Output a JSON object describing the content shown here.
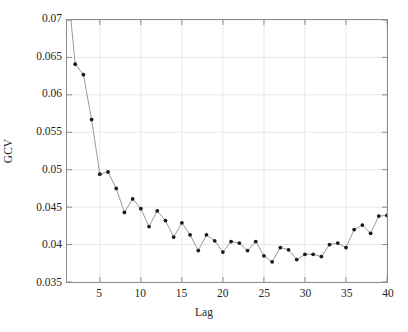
{
  "chart_data": {
    "type": "line",
    "title": "",
    "subtitle": "",
    "xlabel": "Lag",
    "ylabel": "GCV",
    "xlim": [
      1,
      40
    ],
    "ylim": [
      0.035,
      0.07
    ],
    "xticks": [
      5,
      10,
      15,
      20,
      25,
      30,
      35,
      40
    ],
    "xtick_labels": [
      "5",
      "10",
      "15",
      "20",
      "25",
      "30",
      "35",
      "40"
    ],
    "yticks": [
      0.035,
      0.04,
      0.045,
      0.05,
      0.055,
      0.06,
      0.065,
      0.07
    ],
    "ytick_labels": [
      "0.035",
      "0.04",
      "0.045",
      "0.05",
      "0.055",
      "0.06",
      "0.065",
      "0.07"
    ],
    "grid": true,
    "legend": null,
    "legend_position": "none",
    "annotations": [],
    "marker": "dot",
    "line_color": "#8c8c8c",
    "marker_color": "#1a1a1a",
    "grid_color": "#e8e8ec",
    "axis_color": "#8c8c8c",
    "note": "First data point at Lag 1 lies above the visible y-axis maximum and is clipped at the top of the axes.",
    "series": [
      {
        "name": "GCV",
        "x": [
          1,
          2,
          3,
          4,
          5,
          6,
          7,
          8,
          9,
          10,
          11,
          12,
          13,
          14,
          15,
          16,
          17,
          18,
          19,
          20,
          21,
          22,
          23,
          24,
          25,
          26,
          27,
          28,
          29,
          30,
          31,
          32,
          33,
          34,
          35,
          36,
          37,
          38,
          39,
          40
        ],
        "values": [
          0.0755,
          0.0641,
          0.0627,
          0.0567,
          0.0494,
          0.0497,
          0.0475,
          0.0443,
          0.0461,
          0.0448,
          0.0424,
          0.0445,
          0.0432,
          0.041,
          0.0429,
          0.0413,
          0.0392,
          0.0413,
          0.0405,
          0.039,
          0.0404,
          0.0402,
          0.0392,
          0.0404,
          0.0385,
          0.0377,
          0.0396,
          0.0393,
          0.038,
          0.0387,
          0.0387,
          0.0384,
          0.04,
          0.0402,
          0.0396,
          0.042,
          0.0426,
          0.0415,
          0.0438,
          0.0439
        ]
      }
    ]
  },
  "axes": {
    "ylabel_text": "GCV",
    "xlabel_text": "Lag"
  }
}
